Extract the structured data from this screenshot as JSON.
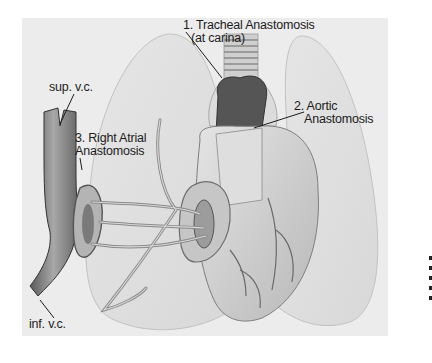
{
  "figure": {
    "type": "anatomical-illustration",
    "labels": {
      "tracheal": {
        "line1": "1. Tracheal Anastomosis",
        "line2": "(at carina)"
      },
      "aortic": {
        "line1": "2. Aortic",
        "line2": "Anastomosis"
      },
      "right_atrial": {
        "line1": "3. Right Atrial",
        "line2": "Anastomosis"
      },
      "sup_vc": "sup. v.c.",
      "inf_vc": "inf. v.c."
    },
    "colors": {
      "background": "#ffffff",
      "panel": "#ececec",
      "lung_fill": "#e2e2e2",
      "lung_edge": "#bdbdbd",
      "heart_fill": "#d4d4d4",
      "vessel_dark": "#6a6a6a",
      "text": "#1c1c1c"
    }
  }
}
